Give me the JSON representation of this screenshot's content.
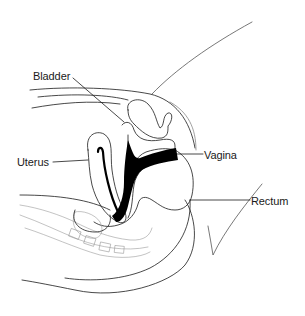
{
  "figure": {
    "type": "anatomical-illustration",
    "view": "sagittal cross-section",
    "labels": [
      {
        "id": "bladder",
        "text": "Bladder"
      },
      {
        "id": "uterus",
        "text": "Uterus"
      },
      {
        "id": "vagina",
        "text": "Vagina"
      },
      {
        "id": "rectum",
        "text": "Rectum"
      }
    ]
  },
  "colors": {
    "background": "#ffffff",
    "line": "#1a1a1a",
    "fill_dark": "#000000",
    "faint_line": "#9a9a9a"
  }
}
